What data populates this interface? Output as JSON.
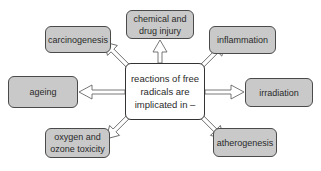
{
  "diagram": {
    "type": "radial-concept-map",
    "center": {
      "lines": [
        "reactions of free",
        "radicals are",
        "implicated in –"
      ]
    },
    "nodes": [
      {
        "id": "carcinogenesis",
        "lines": [
          "carcinogenesis"
        ]
      },
      {
        "id": "chemical-drug-injury",
        "lines": [
          "chemical and",
          "drug injury"
        ]
      },
      {
        "id": "inflammation",
        "lines": [
          "inflammation"
        ]
      },
      {
        "id": "ageing",
        "lines": [
          "ageing"
        ]
      },
      {
        "id": "irradiation",
        "lines": [
          "irradiation"
        ]
      },
      {
        "id": "oxygen-ozone-toxicity",
        "lines": [
          "oxygen and",
          "ozone toxicity"
        ]
      },
      {
        "id": "atherogenesis",
        "lines": [
          "atherogenesis"
        ]
      }
    ],
    "edges": [
      {
        "from": "center",
        "to": "carcinogenesis",
        "style": "hollow-arrow"
      },
      {
        "from": "center",
        "to": "chemical-drug-injury",
        "style": "hollow-arrow"
      },
      {
        "from": "center",
        "to": "inflammation",
        "style": "hollow-arrow"
      },
      {
        "from": "center",
        "to": "ageing",
        "style": "hollow-arrow"
      },
      {
        "from": "center",
        "to": "irradiation",
        "style": "hollow-arrow"
      },
      {
        "from": "center",
        "to": "oxygen-ozone-toxicity",
        "style": "hollow-arrow"
      },
      {
        "from": "center",
        "to": "atherogenesis",
        "style": "hollow-arrow"
      }
    ],
    "colors": {
      "node_fill": "#c9c9c9",
      "node_border": "#4a4a4a",
      "center_fill": "#ffffff",
      "arrow_fill": "#ffffff",
      "arrow_stroke": "#555555",
      "text": "#2a2a2a"
    }
  }
}
